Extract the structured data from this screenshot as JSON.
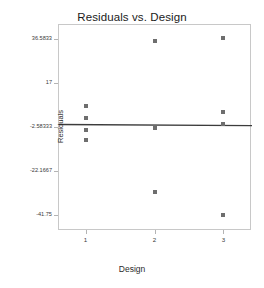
{
  "chart_data": {
    "type": "scatter",
    "title": "Residuals vs. Design",
    "xlabel": "Design",
    "ylabel": "Residuals",
    "grid": false,
    "legend": "none",
    "xlim": [
      0.6,
      3.4
    ],
    "ylim": [
      -48.5,
      43.2
    ],
    "x_tick_labels": [
      "1",
      "2",
      "3"
    ],
    "x_tick_values": [
      1,
      2,
      3
    ],
    "y_tick_labels": [
      "36.5833",
      "17",
      "-2.58333",
      "-22.1667",
      "-41.75"
    ],
    "y_tick_values": [
      36.5833,
      17,
      -2.58333,
      -22.1667,
      -41.75
    ],
    "marker": "square",
    "marker_color": "#6e6e6e",
    "line_color": "#3c3c3c",
    "frame_color": "#c8c8c8",
    "series": [
      {
        "name": "Residuals",
        "points": [
          {
            "x": 1,
            "y": 6.5
          },
          {
            "x": 1,
            "y": 1.2
          },
          {
            "x": 1,
            "y": -4.1
          },
          {
            "x": 1,
            "y": -8.3
          },
          {
            "x": 2,
            "y": 35.6
          },
          {
            "x": 2,
            "y": -3.3
          },
          {
            "x": 2,
            "y": -31.4
          },
          {
            "x": 3,
            "y": 36.8
          },
          {
            "x": 3,
            "y": 4.2
          },
          {
            "x": 3,
            "y": -1.4
          },
          {
            "x": 3,
            "y": -41.8
          }
        ]
      }
    ],
    "fit_line": {
      "name": "reference-line",
      "y_at_xmin": -1.1,
      "y_at_xmax": -1.6
    }
  }
}
